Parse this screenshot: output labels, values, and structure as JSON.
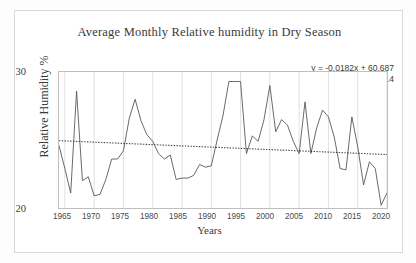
{
  "chart_data": {
    "type": "line",
    "title": "Average Monthly Relative humidity in Dry Season",
    "xlabel": "Years",
    "ylabel": "Relative Humidity %",
    "xlim": [
      1964,
      2020
    ],
    "ylim": [
      20,
      30
    ],
    "yticks": [
      "20",
      "30"
    ],
    "xticks": [
      "1965",
      "1970",
      "1975",
      "1980",
      "1985",
      "1990",
      "1995",
      "2000",
      "2005",
      "2010",
      "2015",
      "2020"
    ],
    "grid": "vertical-only",
    "legend": "none",
    "series_color": "#595959",
    "trendline_color": "#404040",
    "trendline_style": "dotted",
    "annotation": {
      "equation": "y = -0.0182x + 60.687",
      "r_squared": "R² = 0.014"
    },
    "trendline": {
      "slope": -0.0182,
      "intercept": 60.687,
      "y_start": 24.95,
      "y_end": 23.93
    },
    "x": [
      1964,
      1965,
      1966,
      1967,
      1968,
      1969,
      1970,
      1971,
      1972,
      1973,
      1974,
      1975,
      1976,
      1977,
      1978,
      1979,
      1980,
      1981,
      1982,
      1983,
      1984,
      1985,
      1986,
      1987,
      1988,
      1989,
      1990,
      1991,
      1992,
      1993,
      1994,
      1995,
      1996,
      1997,
      1998,
      1999,
      2000,
      2001,
      2002,
      2003,
      2004,
      2005,
      2006,
      2007,
      2008,
      2009,
      2010,
      2011,
      2012,
      2013,
      2014,
      2015,
      2016,
      2017,
      2018,
      2019,
      2020
    ],
    "values": [
      24.6,
      22.9,
      21.1,
      28.6,
      22.0,
      22.3,
      20.9,
      21.0,
      22.1,
      23.6,
      23.6,
      24.2,
      26.6,
      28.0,
      26.4,
      25.4,
      24.9,
      24.0,
      23.6,
      23.9,
      22.1,
      22.2,
      22.2,
      22.4,
      23.2,
      23.0,
      23.1,
      25.0,
      26.8,
      29.3,
      29.3,
      29.3,
      24.0,
      25.3,
      24.9,
      26.5,
      29.0,
      25.6,
      26.5,
      26.1,
      24.9,
      24.0,
      27.8,
      24.0,
      25.9,
      27.2,
      26.7,
      25.2,
      22.9,
      22.8,
      26.7,
      24.5,
      21.7,
      23.4,
      22.9,
      20.2,
      21.1
    ]
  }
}
